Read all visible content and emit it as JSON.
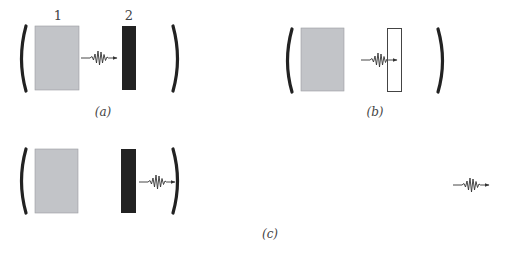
{
  "figure": {
    "panels": [
      {
        "id": "a",
        "caption": "(a)",
        "labels": {
          "box1": "1",
          "box2": "2"
        },
        "elements": [
          "left-mirror",
          "gray-block",
          "wave-packet-arrow",
          "black-block",
          "right-mirror"
        ]
      },
      {
        "id": "b",
        "caption": "(b)",
        "elements": [
          "left-mirror",
          "gray-block",
          "wave-packet-arrow",
          "white-block",
          "right-mirror"
        ]
      },
      {
        "id": "c",
        "caption": "(c)",
        "elements": [
          "left-mirror",
          "gray-block",
          "black-block",
          "wave-packet-arrow",
          "right-mirror",
          "free-wave-packet-arrow"
        ]
      }
    ],
    "colors": {
      "gray_block": "#c2c4c8",
      "black_block": "#222222",
      "white_block": "#ffffff",
      "mirror": "#222222",
      "wave": "#333333"
    }
  }
}
